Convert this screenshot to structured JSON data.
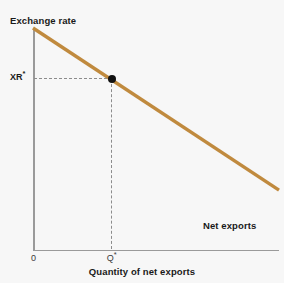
{
  "chart_data": {
    "type": "line",
    "title": "",
    "subtitle": "",
    "xlabel": "Quantity of net exports",
    "ylabel": "Exchange rate",
    "grid": false,
    "legend_position": "inline-right",
    "axis_origin_label": "0",
    "series": [
      {
        "name": "Net exports",
        "color": "#c08a3e",
        "x": [
          0,
          100
        ],
        "y": [
          100,
          27
        ],
        "annotation": "Net exports",
        "description": "Downward-sloping net exports curve: as the exchange rate falls, the quantity of net exports rises."
      }
    ],
    "points": [
      {
        "name": "equilibrium",
        "x": 32,
        "y": 77,
        "x_label": "Q*",
        "y_label": "XR*",
        "marker": "filled-circle",
        "color": "#111111"
      }
    ],
    "guides": [
      {
        "name": "horizontal-dashed-to-XR",
        "orientation": "horizontal",
        "style": "dashed",
        "color": "#8c8c8c"
      },
      {
        "name": "vertical-dashed-to-Q",
        "orientation": "vertical",
        "style": "dashed",
        "color": "#8c8c8c"
      }
    ],
    "xlim": [
      0,
      100
    ],
    "ylim": [
      0,
      100
    ],
    "x_ticks": [
      "0",
      "Q*"
    ],
    "y_ticks": [
      "XR*"
    ]
  },
  "labels": {
    "y_axis_title": "Exchange rate",
    "x_axis_title": "Quantity of net exports",
    "curve_name": "Net exports",
    "origin": "0",
    "y_tick_base": "XR",
    "y_tick_star": "*",
    "x_tick_base": "Q",
    "x_tick_star": "*"
  },
  "colors": {
    "background": "#f7f7f7",
    "axis": "#9a9a9a",
    "curve": "#c08a3e",
    "guide": "#8c8c8c",
    "marker": "#111111",
    "text": "#1a1a1a"
  }
}
